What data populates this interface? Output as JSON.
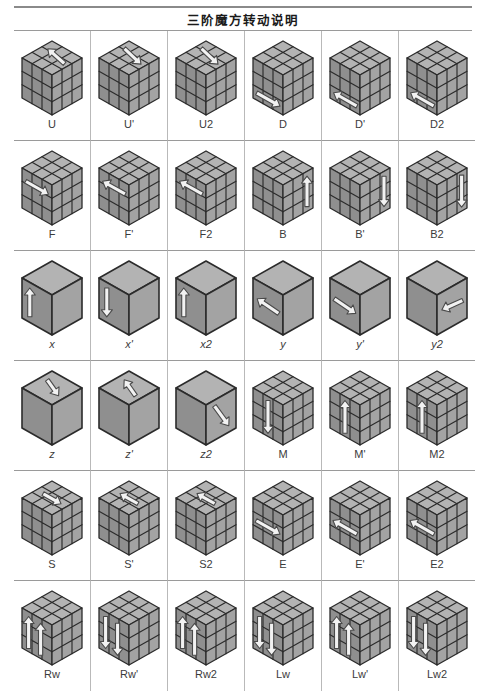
{
  "header": {
    "title": "三阶魔方转动说明"
  },
  "colors": {
    "top_face": "#b3b3b3",
    "left_face": "#8f8f8f",
    "right_face": "#a3a3a3",
    "sticker_line": "#2b2b2b",
    "arrow_fill": "#f2f2f2",
    "arrow_stroke": "#4a4a4a",
    "rule": "#8a8a8a",
    "separator": "#b9b9b9",
    "label_text": "#3b3b3b"
  },
  "grid": {
    "columns": 6,
    "rows": 6
  },
  "moves": [
    {
      "label": "U",
      "style": "grid",
      "arrow": "top-left",
      "italic": false
    },
    {
      "label": "U'",
      "style": "grid",
      "arrow": "top-right",
      "italic": false
    },
    {
      "label": "U2",
      "style": "grid",
      "arrow": "top-right",
      "italic": false
    },
    {
      "label": "D",
      "style": "grid",
      "arrow": "bottom-right",
      "italic": false
    },
    {
      "label": "D'",
      "style": "grid",
      "arrow": "bottom-left",
      "italic": false
    },
    {
      "label": "D2",
      "style": "grid",
      "arrow": "bottom-left",
      "italic": false
    },
    {
      "label": "F",
      "style": "grid",
      "arrow": "front-right",
      "italic": false
    },
    {
      "label": "F'",
      "style": "grid",
      "arrow": "front-left",
      "italic": false
    },
    {
      "label": "F2",
      "style": "grid",
      "arrow": "front-left",
      "italic": false
    },
    {
      "label": "B",
      "style": "grid",
      "arrow": "back-up",
      "italic": false
    },
    {
      "label": "B'",
      "style": "grid",
      "arrow": "back-down",
      "italic": false
    },
    {
      "label": "B2",
      "style": "grid",
      "arrow": "right-down",
      "italic": false
    },
    {
      "label": "x",
      "style": "plain",
      "arrow": "left-up",
      "italic": true
    },
    {
      "label": "x'",
      "style": "plain",
      "arrow": "left-down",
      "italic": true
    },
    {
      "label": "x2",
      "style": "plain",
      "arrow": "left-up",
      "italic": true
    },
    {
      "label": "y",
      "style": "plain",
      "arrow": "left-arrow-flat",
      "italic": true
    },
    {
      "label": "y'",
      "style": "plain",
      "arrow": "right-arrow-flat",
      "italic": true
    },
    {
      "label": "y2",
      "style": "plain",
      "arrow": "right-in-left",
      "italic": true
    },
    {
      "label": "z",
      "style": "plain",
      "arrow": "top-diag-right",
      "italic": true
    },
    {
      "label": "z'",
      "style": "plain",
      "arrow": "top-diag-left",
      "italic": true
    },
    {
      "label": "z2",
      "style": "plain",
      "arrow": "right-diag-down",
      "italic": true
    },
    {
      "label": "M",
      "style": "grid",
      "arrow": "mid-vert-down",
      "italic": false
    },
    {
      "label": "M'",
      "style": "grid",
      "arrow": "mid-vert-up",
      "italic": false
    },
    {
      "label": "M2",
      "style": "grid",
      "arrow": "mid-vert-up",
      "italic": false
    },
    {
      "label": "S",
      "style": "grid",
      "arrow": "top-mid-right",
      "italic": false
    },
    {
      "label": "S'",
      "style": "grid",
      "arrow": "top-mid-left",
      "italic": false
    },
    {
      "label": "S2",
      "style": "grid",
      "arrow": "top-mid-left",
      "italic": false
    },
    {
      "label": "E",
      "style": "grid",
      "arrow": "left-mid-right",
      "italic": false
    },
    {
      "label": "E'",
      "style": "grid",
      "arrow": "left-mid-left",
      "italic": false
    },
    {
      "label": "E2",
      "style": "grid",
      "arrow": "left-mid-left",
      "italic": false
    },
    {
      "label": "Rw",
      "style": "grid",
      "arrow": "double-vert-up",
      "italic": false
    },
    {
      "label": "Rw'",
      "style": "grid",
      "arrow": "double-vert-down",
      "italic": false
    },
    {
      "label": "Rw2",
      "style": "grid",
      "arrow": "double-vert-up",
      "italic": false
    },
    {
      "label": "Lw",
      "style": "grid",
      "arrow": "double-vert-down",
      "italic": false
    },
    {
      "label": "Lw'",
      "style": "grid",
      "arrow": "double-vert-up",
      "italic": false
    },
    {
      "label": "Lw2",
      "style": "grid",
      "arrow": "double-vert-down",
      "italic": false
    }
  ]
}
